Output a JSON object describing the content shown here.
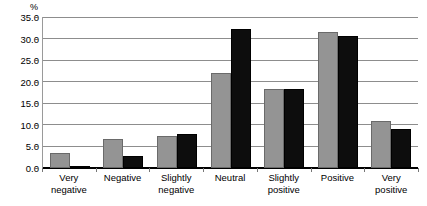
{
  "chart_data": {
    "type": "bar",
    "title": "",
    "subtitle": "",
    "xlabel": "",
    "ylabel": "%",
    "y_unit_label": "%",
    "categories": [
      "Very\nnegative",
      "Negative",
      "Slightly\nnegative",
      "Neutral",
      "Slightly\npositive",
      "Positive",
      "Very\npositive"
    ],
    "series": [
      {
        "name": "Series 1",
        "color": "#949494",
        "values": [
          3.5,
          6.7,
          7.5,
          22.1,
          18.3,
          31.5,
          11.0
        ]
      },
      {
        "name": "Series 2",
        "color": "#0d0d0d",
        "values": [
          0.4,
          2.8,
          8.0,
          32.3,
          18.3,
          30.5,
          9.0
        ]
      }
    ],
    "ylim": [
      0.0,
      35.0
    ],
    "ytick_step": 5.0,
    "ytick_labels": [
      "35.0",
      "30.0",
      "25.0",
      "20.0",
      "15.0",
      "10.0",
      "5.0",
      "0.0"
    ],
    "ytick_values": [
      35.0,
      30.0,
      25.0,
      20.0,
      15.0,
      10.0,
      5.0,
      0.0
    ],
    "grid": true,
    "grid_axis": "y",
    "legend": false,
    "legend_position": "none",
    "annotations": []
  }
}
